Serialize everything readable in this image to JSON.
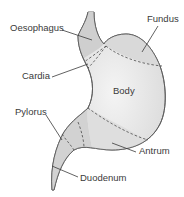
{
  "diagram": {
    "colors": {
      "fill": "#dcdcdc",
      "fill_light": "#eeeeee",
      "outline": "#5a5a5a",
      "text": "#3a3a3a"
    },
    "labels": {
      "oesophagus": "Oesophagus",
      "fundus": "Fundus",
      "cardia": "Cardia",
      "body": "Body",
      "pylorus": "Pylorus",
      "antrum": "Antrum",
      "duodenum": "Duodenum"
    }
  }
}
